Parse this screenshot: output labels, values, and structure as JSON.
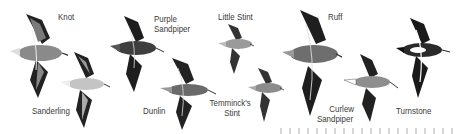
{
  "figure": {
    "birds": [
      {
        "name": "Knot",
        "label": "Knot",
        "tone": "#8a8a8a"
      },
      {
        "name": "Sanderling",
        "label": "Sanderling",
        "tone": "#c4c4c4"
      },
      {
        "name": "Purple Sandpiper",
        "label_line1": "Purple",
        "label_line2": "Sandpiper",
        "tone": "#3e3e3e"
      },
      {
        "name": "Dunlin",
        "label": "Dunlin",
        "tone": "#6a6a6a"
      },
      {
        "name": "Little Stint",
        "label": "Little Stint",
        "tone": "#9a9a9a"
      },
      {
        "name": "Temminck's Stint",
        "label_line1": "Temminck's",
        "label_line2": "Stint",
        "tone": "#8c8c8c"
      },
      {
        "name": "Ruff",
        "label": "Ruff",
        "tone": "#6e6e6e"
      },
      {
        "name": "Curlew Sandpiper",
        "label_line1": "Curlew",
        "label_line2": "Sandpiper",
        "tone": "#8e8e8e"
      },
      {
        "name": "Turnstone",
        "label": "Turnstone",
        "tone": "#2a2a2a"
      }
    ],
    "colors": {
      "background": "#ffffff",
      "label_text": "#3a3a3a",
      "wing_dark": "#1e1e1e",
      "wing_bar": "#e8e8e8"
    }
  }
}
